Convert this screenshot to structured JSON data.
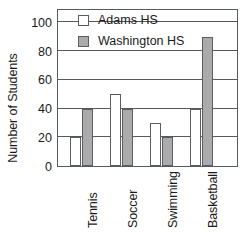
{
  "chart_data": {
    "type": "bar",
    "title": "",
    "xlabel": "",
    "ylabel": "Number of Students",
    "ylim": [
      0,
      110
    ],
    "yticks": [
      0,
      20,
      40,
      60,
      80,
      100
    ],
    "ytick_labels": [
      "0",
      "20",
      "40",
      "60",
      "80",
      "100"
    ],
    "grid": true,
    "grid_axis": "y",
    "legend_position": "top-inside-left",
    "categories": [
      "Tennis",
      "Soccer",
      "Swimming",
      "Basketball"
    ],
    "series": [
      {
        "name": "Adams HS",
        "color": "#ffffff",
        "values": [
          20,
          50,
          30,
          40
        ]
      },
      {
        "name": "Washington HS",
        "color": "#ababab",
        "values": [
          40,
          40,
          20,
          90
        ]
      }
    ]
  },
  "legend": {
    "entries": [
      {
        "label": "Adams HS",
        "swatch": "white-square-swatch"
      },
      {
        "label": "Washington HS",
        "swatch": "gray-square-swatch"
      }
    ]
  },
  "axes": {
    "y_title": "Number of Students"
  },
  "colors": {
    "adams_fill": "#ffffff",
    "washington_fill": "#ababab",
    "stroke": "#55595d",
    "background": "#ffffff"
  }
}
